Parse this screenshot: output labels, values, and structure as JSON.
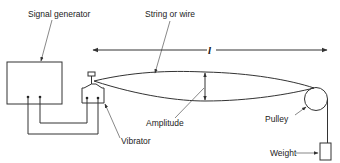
{
  "diagram": {
    "type": "standing-wave-apparatus",
    "labels": {
      "signal_generator": "Signal generator",
      "string": "String or wire",
      "length": "l",
      "amplitude": "Amplitude",
      "vibrator": "Vibrator",
      "pulley": "Pulley",
      "weight": "Weight"
    },
    "colors": {
      "line": "#333333",
      "text": "#222222",
      "background": "#ffffff"
    }
  }
}
